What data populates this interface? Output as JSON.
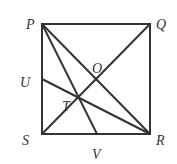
{
  "diagram": {
    "type": "geometry-square",
    "points": {
      "P": {
        "label": "P",
        "x": 42,
        "y": 24
      },
      "Q": {
        "label": "Q",
        "x": 150,
        "y": 24
      },
      "R": {
        "label": "R",
        "x": 150,
        "y": 134
      },
      "S": {
        "label": "S",
        "x": 42,
        "y": 134
      },
      "U": {
        "label": "U",
        "x": 42,
        "y": 79
      },
      "V": {
        "label": "V",
        "x": 97,
        "y": 134
      },
      "O": {
        "label": "O",
        "x": 96,
        "y": 79
      },
      "T": {
        "label": "T",
        "x": 79,
        "y": 98
      }
    },
    "segments": [
      "PQ",
      "QR",
      "RS",
      "SP",
      "PR",
      "QS",
      "PV",
      "UR"
    ],
    "line_color": "#333333"
  }
}
